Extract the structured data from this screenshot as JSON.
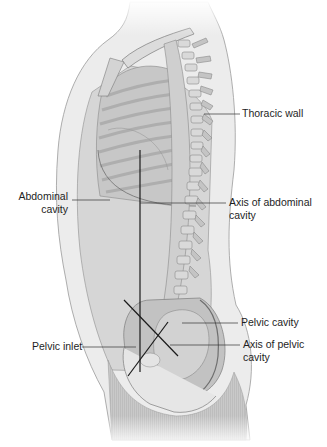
{
  "figure": {
    "colors": {
      "skin": "#e9e9e9",
      "skin_outline": "#9a9a9a",
      "body_fill": "#cfcfcf",
      "bone": "#d8d8d8",
      "bone_dark": "#a9a9a9",
      "cavity": "#bdbdbd",
      "axis_line": "#1a1a1a",
      "leader_line": "#333333",
      "text": "#1e1e1e"
    }
  },
  "labels": {
    "thoracic_wall": "Thoracic wall",
    "abdominal_cavity_line1": "Abdominal",
    "abdominal_cavity_line2": "cavity",
    "axis_abdominal_line1": "Axis of abdominal",
    "axis_abdominal_line2": "cavity",
    "pelvic_cavity": "Pelvic cavity",
    "pelvic_inlet": "Pelvic inlet",
    "axis_pelvic_line1": "Axis of pelvic",
    "axis_pelvic_line2": "cavity"
  }
}
